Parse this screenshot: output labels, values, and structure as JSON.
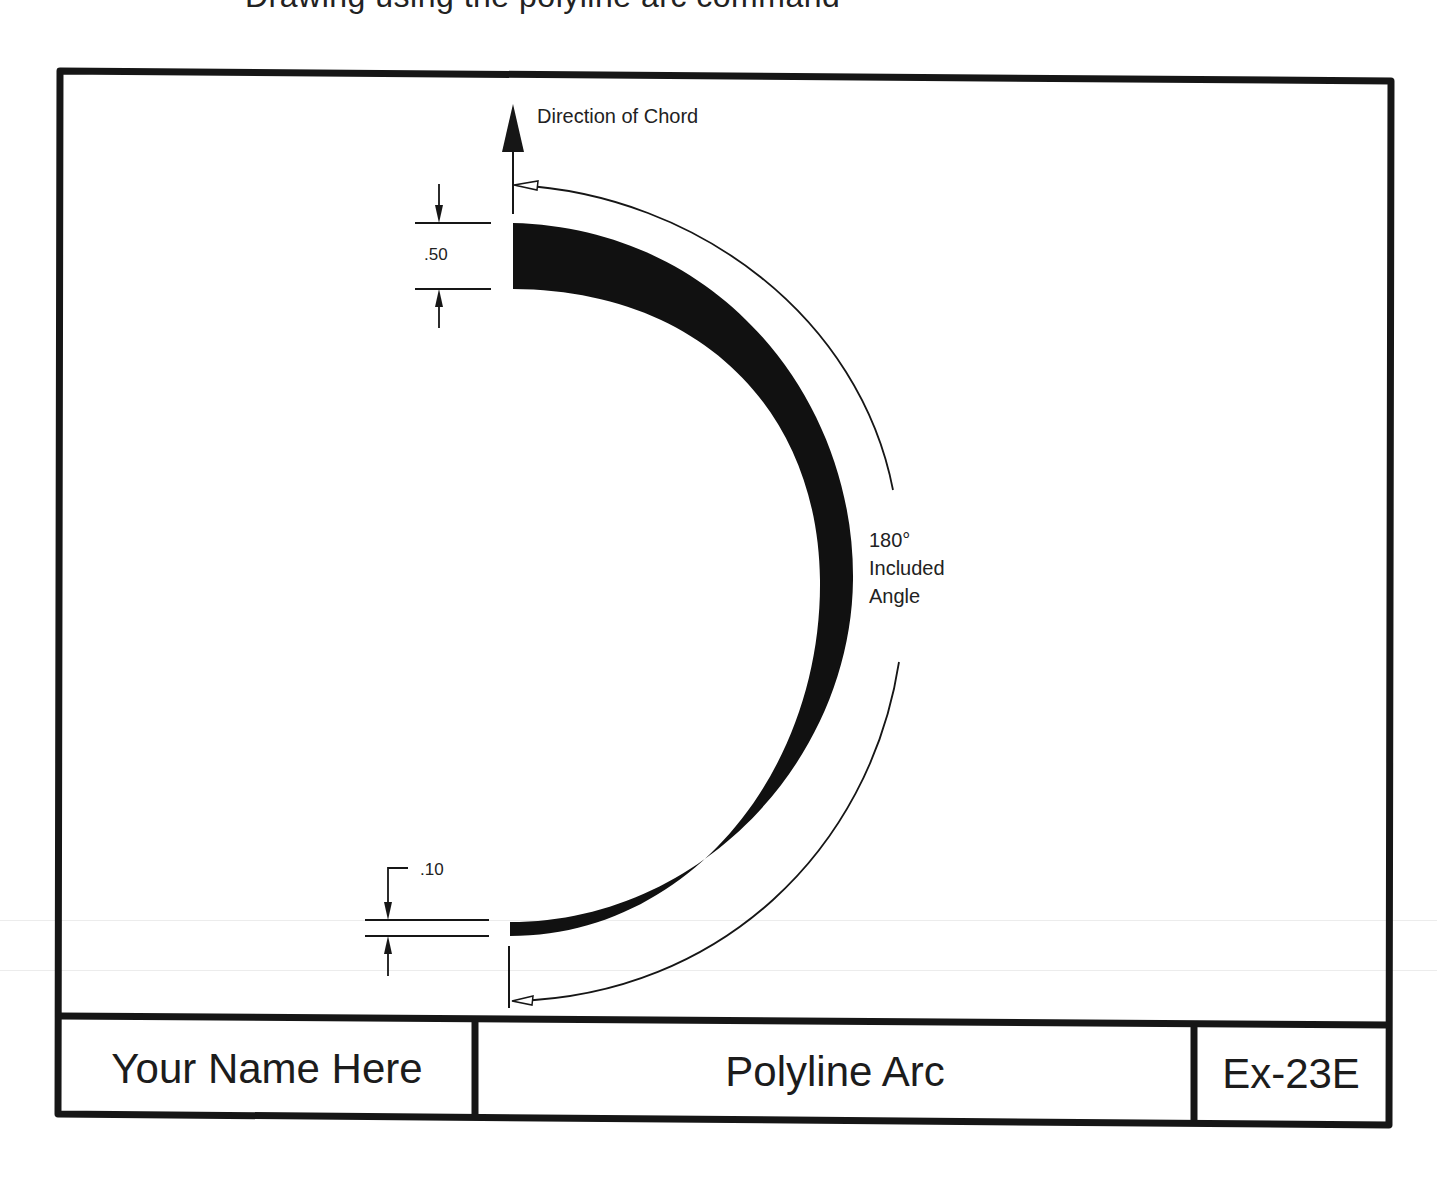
{
  "page": {
    "cropped_header_text": "Drawing using the polyline arc command"
  },
  "drawing": {
    "labels": {
      "direction": "Direction of Chord",
      "start_width": ".50",
      "end_width": ".10",
      "angle_value": "180°",
      "angle_line1": "Included",
      "angle_line2": "Angle"
    },
    "arc": {
      "included_angle_deg": 180,
      "start_width": 0.5,
      "end_width": 0.1,
      "fill_color": "#111111"
    }
  },
  "title_block": {
    "name": "Your Name Here",
    "title": "Polyline Arc",
    "number": "Ex-23E"
  },
  "colors": {
    "line": "#161616",
    "text": "#1c1c1c",
    "background": "#ffffff"
  }
}
